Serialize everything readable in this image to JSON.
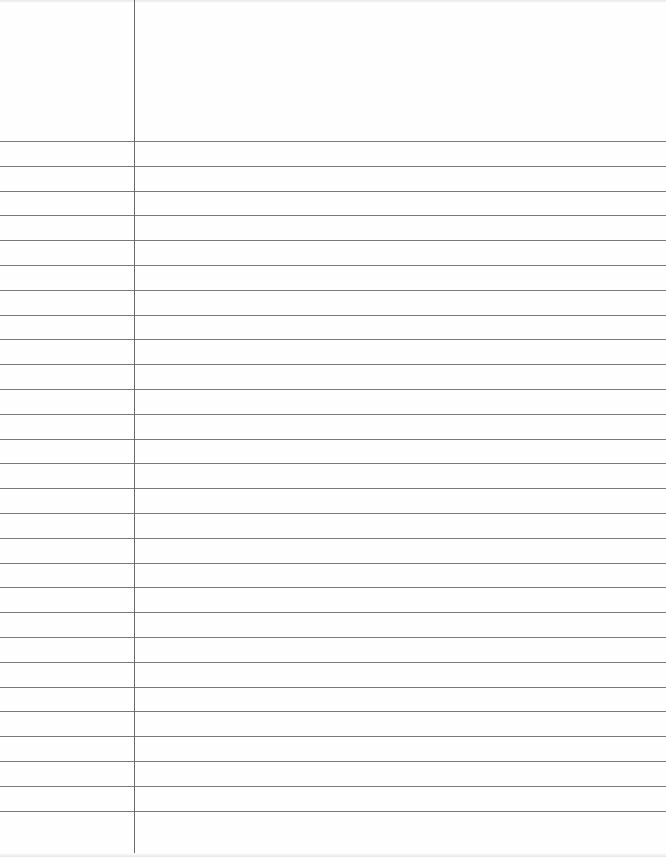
{
  "page": {
    "type": "lined-notebook-paper",
    "background_color": "#fefefe",
    "line_color": "#7a7a7a",
    "margin_line_color": "#6a6a6a",
    "margin_x": 134,
    "first_rule_y": 141,
    "rule_spacing": 24.8,
    "rule_count": 28
  }
}
